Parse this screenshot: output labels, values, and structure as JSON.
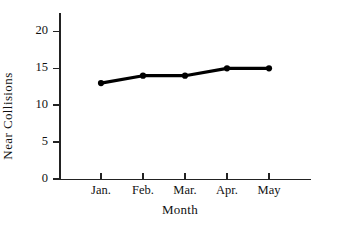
{
  "chart_data": {
    "type": "line",
    "title": "",
    "xlabel": "Month",
    "ylabel": "Near Collisions",
    "categories": [
      "Jan.",
      "Feb.",
      "Mar.",
      "Apr.",
      "May"
    ],
    "values": [
      13,
      14,
      14,
      15,
      15
    ],
    "series": [
      {
        "name": "Near Collisions",
        "values": [
          13,
          14,
          14,
          15,
          15
        ],
        "color": "#000000",
        "marker": "circle"
      }
    ],
    "ylim": [
      0,
      22.5
    ],
    "xlim": [
      0,
      6
    ],
    "yticks": [
      0,
      5,
      10,
      15,
      20
    ],
    "ytick_labels": [
      "0",
      "5",
      "10",
      "15",
      "20"
    ],
    "xtick_labels": [
      "Jan.",
      "Feb.",
      "Mar.",
      "Apr.",
      "May"
    ],
    "grid": false,
    "legend": "none",
    "background_color": "#ffffff",
    "axis_color": "#222222"
  },
  "axes": {
    "x_title": "Month",
    "y_title": "Near Collisions"
  }
}
